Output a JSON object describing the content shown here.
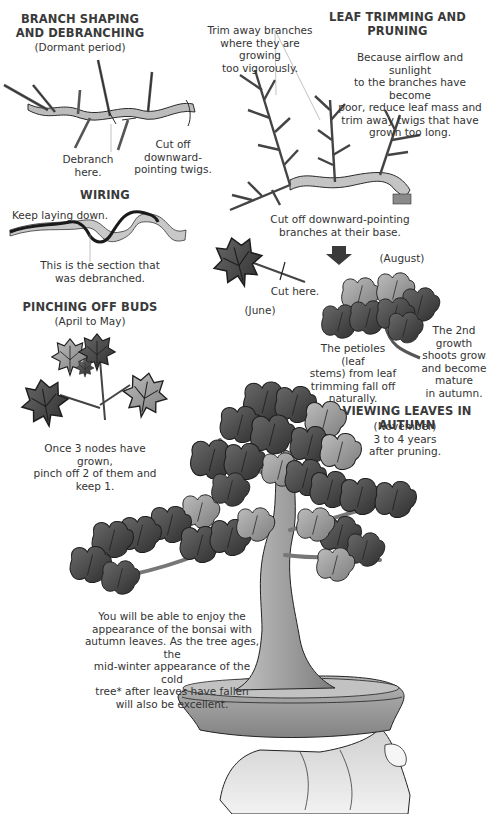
{
  "sections": {
    "branch_shaping": {
      "title": "BRANCH SHAPING\nAND DEBRANCHING",
      "subtitle": "(Dormant period)",
      "label_debranch": "Debranch here.",
      "label_cut_twigs": "Cut off downward-\npointing twigs."
    },
    "wiring": {
      "title": "WIRING",
      "label_keep": "Keep laying down.",
      "label_section": "This is the section that\nwas debranched."
    },
    "pinching": {
      "title": "PINCHING OFF BUDS",
      "subtitle": "(April to May)",
      "caption": "Once 3 nodes have grown,\npinch off 2 of them and\nkeep 1."
    },
    "leaf_trimming": {
      "title": "LEAF TRIMMING AND PRUNING",
      "label_trim": "Trim away branches\nwhere they are growing\ntoo vigorously.",
      "label_airflow": "Because airflow and sunlight\nto the branches have become\npoor, reduce leaf mass and\ntrim away twigs that have\ngrown too long.",
      "label_cut_base": "Cut off downward-pointing\nbranches at their base.",
      "label_cut_here": "Cut here.",
      "label_june": "(June)",
      "label_august": "(August)",
      "label_petioles": "The petioles (leaf\nstems) from leaf\ntrimming fall off\nnaturally.",
      "label_second_growth": "The 2nd\ngrowth\nshoots grow\nand become\nmature\nin autumn."
    },
    "viewing": {
      "title": "VIEWING LEAVES IN AUTUMN",
      "subtitle": "(November)\n3 to 4 years\nafter pruning.",
      "caption": "You will be able to enjoy the\nappearance of the bonsai with\nautumn leaves. As the tree ages, the\nmid-winter appearance of the cold\ntree* after leaves have fallen\nwill also be excellent."
    }
  },
  "colors": {
    "leaf_dark": "#4a4a4a",
    "leaf_light": "#9a9a9a",
    "bark": "#a8a8a8",
    "soil": "#b8b8b8",
    "pot": "#9e9e9e",
    "hand": "#e2e2e2",
    "outline": "#1e1e1e"
  }
}
